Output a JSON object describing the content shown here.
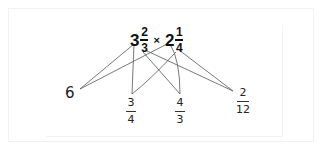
{
  "problem": {
    "left_whole": "3",
    "left_num": "2",
    "left_den": "3",
    "operator": "×",
    "right_whole": "2",
    "right_num": "1",
    "right_den": "4"
  },
  "products": [
    {
      "value": "6"
    },
    {
      "num": "3",
      "den": "4"
    },
    {
      "num": "4",
      "den": "3"
    },
    {
      "num": "2",
      "den": "12"
    }
  ],
  "colors": {
    "ink": "#111111",
    "lines": "#555555",
    "frame": "#f1f1f1"
  }
}
